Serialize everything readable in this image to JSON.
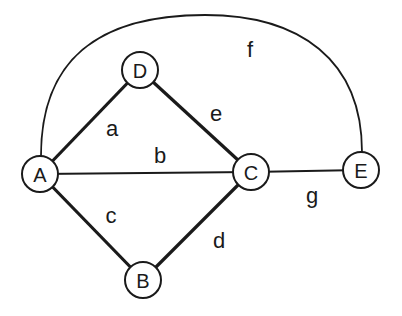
{
  "graph": {
    "nodes": [
      {
        "id": "A",
        "label": "A",
        "x": 40,
        "y": 174
      },
      {
        "id": "D",
        "label": "D",
        "x": 140,
        "y": 70
      },
      {
        "id": "C",
        "label": "C",
        "x": 251,
        "y": 172
      },
      {
        "id": "E",
        "label": "E",
        "x": 361,
        "y": 170
      },
      {
        "id": "B",
        "label": "B",
        "x": 143,
        "y": 280
      }
    ],
    "edges": [
      {
        "id": "a",
        "label": "a",
        "from": "A",
        "to": "D",
        "weight": "thick"
      },
      {
        "id": "b",
        "label": "b",
        "from": "A",
        "to": "C",
        "weight": "thin"
      },
      {
        "id": "c",
        "label": "c",
        "from": "A",
        "to": "B",
        "weight": "thick"
      },
      {
        "id": "d",
        "label": "d",
        "from": "B",
        "to": "C",
        "weight": "thick"
      },
      {
        "id": "e",
        "label": "e",
        "from": "D",
        "to": "C",
        "weight": "thick"
      },
      {
        "id": "f",
        "label": "f",
        "from": "A",
        "to": "E",
        "weight": "thin",
        "shape": "arc"
      },
      {
        "id": "g",
        "label": "g",
        "from": "C",
        "to": "E",
        "weight": "thin"
      }
    ]
  }
}
